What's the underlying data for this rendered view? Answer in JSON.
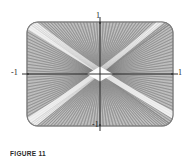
{
  "figure": {
    "caption": "FIGURE 11",
    "axis_labels": {
      "top": "1",
      "bottom": "-1",
      "left": "-1",
      "right": "1"
    },
    "colors": {
      "background": "#ffffff",
      "mesh_line": "#8a8a8a",
      "mesh_light": "#ffffff",
      "mesh_dark": "#6e6e6e",
      "fill": "#b4b4b4",
      "axis": "#1a1a1a",
      "text": "#1a1a1a"
    }
  },
  "chart_data": {
    "type": "line",
    "title": "",
    "subtitle": "",
    "xlabel": "",
    "ylabel": "",
    "xlim": [
      -1.45,
      1.45
    ],
    "ylim": [
      -1.05,
      1.05
    ],
    "xticks": [
      -1,
      1
    ],
    "yticks": [
      -1,
      1
    ],
    "xticklabels": [
      "-1",
      "1"
    ],
    "yticklabels": [
      "-1",
      "1"
    ],
    "grid": false,
    "legend": null,
    "domain": {
      "u": [
        -1.4,
        1.4
      ],
      "v": [
        -1.0,
        1.0
      ],
      "u_divisions": 44,
      "v_divisions": 30
    },
    "series": [
      {
        "name": "u-mesh-lines",
        "count": 44,
        "orientation": "family-1-diagonal"
      },
      {
        "name": "v-mesh-lines",
        "count": 44,
        "orientation": "family-2-diagonal"
      }
    ],
    "annotations": [
      {
        "text": "1",
        "x": 0,
        "y": 1.12,
        "name": "y-max-tick-label"
      },
      {
        "text": "-1",
        "x": 0,
        "y": -1.12,
        "name": "y-min-tick-label"
      },
      {
        "text": "-1",
        "x": -1.48,
        "y": 0,
        "name": "x-min-tick-label"
      },
      {
        "text": "1",
        "x": 1.48,
        "y": 0,
        "name": "x-max-tick-label"
      }
    ]
  }
}
